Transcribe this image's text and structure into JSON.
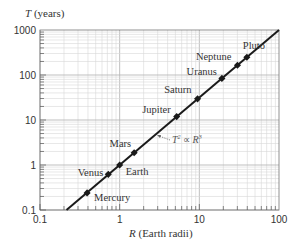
{
  "chart_data": {
    "type": "scatter",
    "title": "",
    "xlabel": "R (Earth radii)",
    "ylabel": "T (years)",
    "xscale": "log",
    "yscale": "log",
    "xlim": [
      0.1,
      100
    ],
    "ylim": [
      0.1,
      1000
    ],
    "x_ticks": [
      "0.1",
      "1",
      "10",
      "100"
    ],
    "y_ticks": [
      "0.1",
      "1",
      "10",
      "100",
      "1000"
    ],
    "grid": true,
    "legend": null,
    "series": [
      {
        "name": "Planets",
        "points": [
          {
            "label": "Mercury",
            "x": 0.39,
            "y": 0.24
          },
          {
            "label": "Venus",
            "x": 0.72,
            "y": 0.62
          },
          {
            "label": "Earth",
            "x": 1.0,
            "y": 1.0
          },
          {
            "label": "Mars",
            "x": 1.52,
            "y": 1.88
          },
          {
            "label": "Jupiter",
            "x": 5.2,
            "y": 11.9
          },
          {
            "label": "Saturn",
            "x": 9.5,
            "y": 29.5
          },
          {
            "label": "Uranus",
            "x": 19.2,
            "y": 84
          },
          {
            "label": "Neptune",
            "x": 30.1,
            "y": 165
          },
          {
            "label": "Pluto",
            "x": 39.5,
            "y": 248
          }
        ]
      },
      {
        "name": "Fit line",
        "type": "line",
        "x": [
          0.215,
          100
        ],
        "y": [
          0.1,
          1000
        ]
      }
    ],
    "annotations": [
      {
        "text": "T² ∝ R³",
        "x": 8,
        "y": 7
      }
    ]
  },
  "labels": {
    "y_axis_title_var": "T",
    "y_axis_title_unit": " (years)",
    "x_axis_title_var": "R",
    "x_axis_title_unit": " (Earth radii)",
    "annotation_lhs": "T",
    "annotation_exp1": "2",
    "annotation_mid": " ∝ ",
    "annotation_rhs": "R",
    "annotation_exp2": "3"
  },
  "colors": {
    "line": "#1a1a1a",
    "marker": "#1a1a1a",
    "grid_major": "#b8b8b8",
    "grid_minor": "#d6d6d6",
    "frame": "#555555"
  }
}
